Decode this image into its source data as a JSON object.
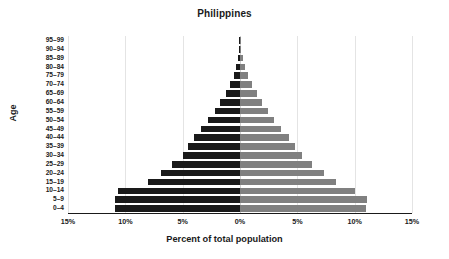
{
  "chart_data": {
    "type": "bar",
    "subtype": "population-pyramid",
    "title": "Philippines",
    "xlabel": "Percent of total population",
    "ylabel": "Age",
    "categories": [
      "95–99",
      "90–94",
      "85–89",
      "80–84",
      "75–79",
      "70–74",
      "65–69",
      "60–64",
      "55–59",
      "50–54",
      "45–49",
      "40–44",
      "35–39",
      "30–34",
      "25–29",
      "20–24",
      "15–19",
      "10–14",
      "5–9",
      "0–4"
    ],
    "series": [
      {
        "name": "Male",
        "side": "left",
        "color": "#1a1a1a",
        "values": [
          0.02,
          0.06,
          0.15,
          0.32,
          0.55,
          0.85,
          1.25,
          1.75,
          2.2,
          2.8,
          3.4,
          4.0,
          4.5,
          5.0,
          5.9,
          6.9,
          8.0,
          10.6,
          10.9,
          10.9
        ]
      },
      {
        "name": "Female",
        "side": "right",
        "color": "#808080",
        "values": [
          0.03,
          0.09,
          0.22,
          0.45,
          0.72,
          1.05,
          1.45,
          1.95,
          2.4,
          3.0,
          3.6,
          4.3,
          4.8,
          5.4,
          6.3,
          7.3,
          8.4,
          10.0,
          11.1,
          11.0
        ]
      }
    ],
    "xlim": [
      -15,
      15
    ],
    "xticks": [
      -15,
      -10,
      -5,
      0,
      5,
      10,
      15
    ],
    "xtick_labels": [
      "15%",
      "10%",
      "5%",
      "0%",
      "5%",
      "10%",
      "15%"
    ],
    "grid": true,
    "grid_axis": "x",
    "legend": "none"
  },
  "layout": {
    "plot_left": 68,
    "plot_top": 36,
    "plot_width": 344,
    "plot_height": 177,
    "px_per_percent": 11.4666,
    "center_x": 172
  },
  "colors": {
    "background": "#ffffff",
    "text": "#1a1a1a",
    "gridline": "#e4e4e4",
    "center_gridline": "#d0d0d0",
    "male_bar": "#1a1a1a",
    "female_bar": "#808080"
  }
}
